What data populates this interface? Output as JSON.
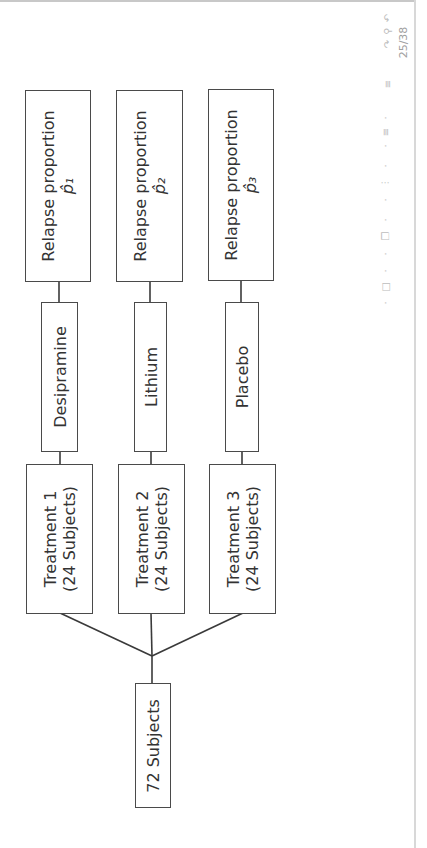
{
  "slide": {
    "page_current": "25",
    "page_total": "38",
    "page_label": "25/38"
  },
  "diagram": {
    "root": {
      "label": "72 Subjects"
    },
    "treatments": [
      {
        "label_line1": "Treatment 1",
        "label_line2": "(24 Subjects)",
        "drug": "Desipramine",
        "outcome_line1": "Relapse proportion",
        "outcome_line2": "p̂₁"
      },
      {
        "label_line1": "Treatment 2",
        "label_line2": "(24 Subjects)",
        "drug": "Lithium",
        "outcome_line1": "Relapse proportion",
        "outcome_line2": "p̂₂"
      },
      {
        "label_line1": "Treatment 3",
        "label_line2": "(24 Subjects)",
        "drug": "Placebo",
        "outcome_line1": "Relapse proportion",
        "outcome_line2": "p̂₃"
      }
    ]
  },
  "nav_icons": [
    "frame-prev-icon",
    "frame-icon",
    "frame-next-icon",
    "section-prev-icon",
    "section-icon",
    "section-next-icon",
    "subsection-icon",
    "align-icon",
    "back-icon",
    "search-icon",
    "forward-icon"
  ]
}
